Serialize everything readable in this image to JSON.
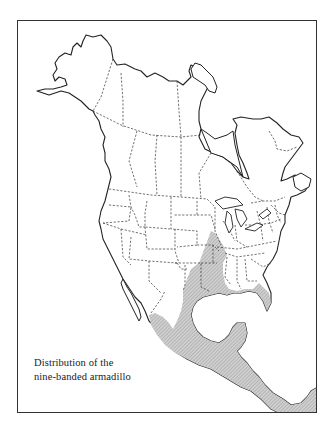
{
  "map": {
    "title_line1": "Distribution of the",
    "title_line2": "nine-banded armadillo",
    "region": "North America",
    "legend": {
      "shaded_area": "Range of the nine-banded armadillo"
    },
    "colors": {
      "land": "#ffffff",
      "coastline": "#222222",
      "border": "#333333",
      "range_fill": "#c8c8c8",
      "range_hatch": "#9a9a9a"
    }
  }
}
